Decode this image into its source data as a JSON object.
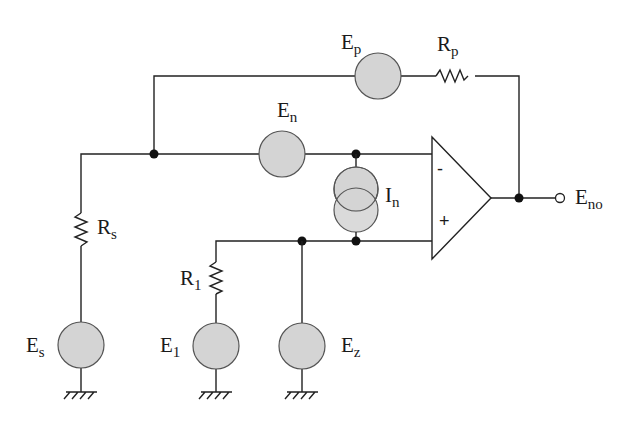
{
  "diagram": {
    "colors": {
      "wire": "#222222",
      "source_fill": "#d4d4d4",
      "source_stroke": "#555555",
      "background": "#ffffff"
    },
    "labels": {
      "ep": {
        "main": "E",
        "sub": "p"
      },
      "rp": {
        "main": "R",
        "sub": "p"
      },
      "en": {
        "main": "E",
        "sub": "n"
      },
      "in": {
        "main": "I",
        "sub": "n"
      },
      "eno": {
        "main": "E",
        "sub": "no"
      },
      "rs": {
        "main": "R",
        "sub": "s"
      },
      "r1": {
        "main": "R",
        "sub": "1"
      },
      "es": {
        "main": "E",
        "sub": "s"
      },
      "e1": {
        "main": "E",
        "sub": "1"
      },
      "ez": {
        "main": "E",
        "sub": "z"
      }
    },
    "opamp": {
      "inverting_symbol": "-",
      "noninverting_symbol": "+"
    }
  }
}
